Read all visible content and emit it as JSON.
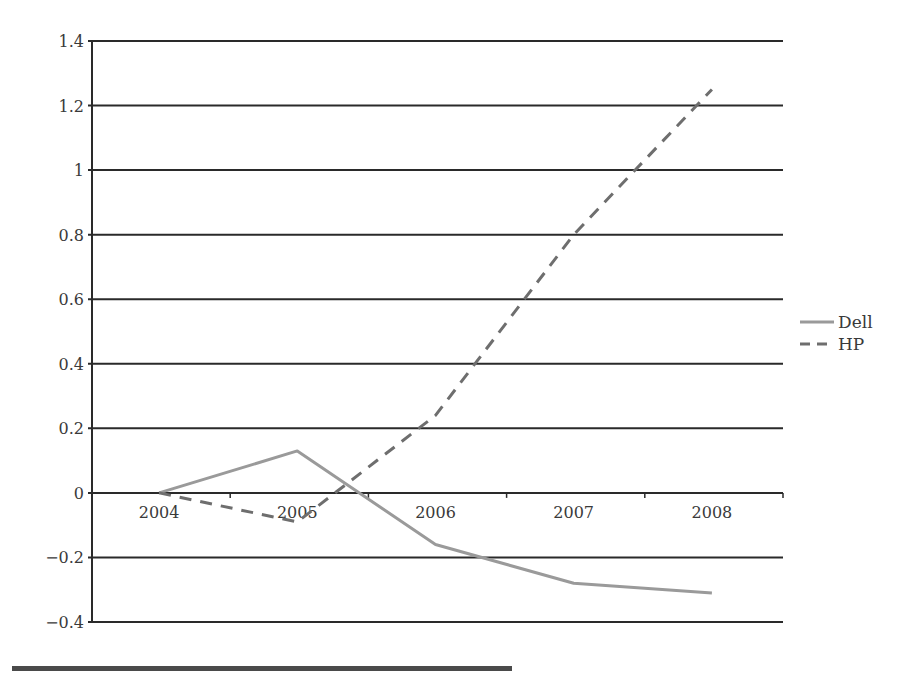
{
  "chart_data": {
    "type": "line",
    "title": "",
    "xlabel": "",
    "ylabel": "",
    "categories": [
      "2004",
      "2005",
      "2006",
      "2007",
      "2008"
    ],
    "series": [
      {
        "name": "Dell",
        "style": "solid",
        "color": "#9a9a9a",
        "values": [
          0,
          0.13,
          -0.16,
          -0.28,
          -0.31
        ]
      },
      {
        "name": "HP",
        "style": "dashed",
        "color": "#6e6e6e",
        "values": [
          0,
          -0.09,
          0.24,
          0.8,
          1.25
        ]
      }
    ],
    "ylim": [
      -0.4,
      1.4
    ],
    "yticks": [
      1.4,
      1.2,
      1,
      0.8,
      0.6,
      0.4,
      0.2,
      0,
      -0.2,
      -0.4
    ],
    "ytick_labels": [
      "1.4",
      "1.2",
      "1",
      "0.8",
      "0.6",
      "0.4",
      "0.2",
      "0",
      "−0.2",
      "−0.4"
    ],
    "grid": {
      "horizontal": true,
      "vertical": false,
      "color": "#2a2a2a"
    },
    "legend": {
      "position": "right",
      "entries": [
        "Dell",
        "HP"
      ]
    }
  }
}
